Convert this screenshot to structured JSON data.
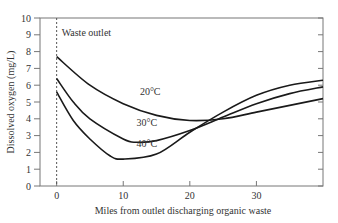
{
  "chart_data": {
    "type": "line",
    "title": "",
    "xlabel": "Miles from outlet discharging organic waste",
    "ylabel": "Dissolved oxygen (mg/L)",
    "xlim": [
      -2.5,
      40
    ],
    "ylim": [
      0,
      10
    ],
    "x_ticks": [
      0,
      10,
      20,
      30
    ],
    "y_ticks": [
      0,
      1,
      2,
      3,
      4,
      5,
      6,
      7,
      8,
      9,
      10
    ],
    "grid": false,
    "legend": "inline labels",
    "annotations": [
      {
        "text": "Waste outlet",
        "x": 0,
        "type": "vertical dashed line"
      }
    ],
    "series": [
      {
        "name": "20°C",
        "x": [
          0,
          5,
          10,
          15,
          20,
          25,
          30,
          35,
          40
        ],
        "values": [
          7.7,
          6.0,
          4.9,
          4.2,
          3.9,
          4.0,
          4.4,
          4.8,
          5.2
        ]
      },
      {
        "name": "30°C",
        "x": [
          0,
          2.5,
          5,
          10,
          12,
          15,
          20,
          25,
          30,
          35,
          40
        ],
        "values": [
          6.4,
          5.0,
          4.0,
          2.8,
          2.6,
          2.7,
          3.3,
          4.1,
          4.9,
          5.5,
          5.9
        ]
      },
      {
        "name": "40°C",
        "x": [
          0,
          2.5,
          5,
          8,
          10,
          15,
          20,
          25,
          30,
          35,
          40
        ],
        "values": [
          5.6,
          3.9,
          2.8,
          1.8,
          1.6,
          1.9,
          3.2,
          4.4,
          5.4,
          6.0,
          6.3
        ]
      }
    ],
    "series_labels": [
      {
        "text": "20°C",
        "x": 12.5,
        "y": 5.4
      },
      {
        "text": "30°C",
        "x": 12.0,
        "y": 3.6
      },
      {
        "text": "40°C",
        "x": 12.0,
        "y": 2.3
      }
    ]
  }
}
